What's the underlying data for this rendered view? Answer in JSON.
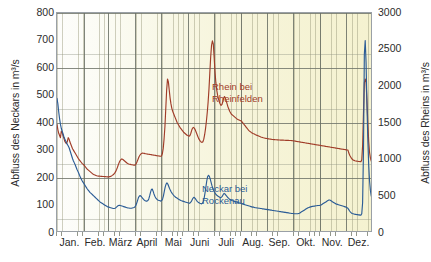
{
  "chart_data": {
    "type": "line",
    "title": "",
    "xlabel": "",
    "grid": true,
    "legend_position": "in-plot-annotations",
    "x_tick_labels": [
      "Jan.",
      "Feb.",
      "März",
      "April",
      "Mai",
      "Juni",
      "Juli",
      "Aug.",
      "Sep.",
      "Okt.",
      "Nov.",
      "Dez."
    ],
    "axes": {
      "left": {
        "label": "Abfluss des Neckars in m³/s",
        "ticks": [
          0,
          100,
          200,
          300,
          400,
          500,
          600,
          700,
          800
        ],
        "ylim": [
          0,
          800
        ],
        "color": "#2b5c96"
      },
      "right": {
        "label": "Abfluss des Rheins in m³/s",
        "ticks": [
          0,
          500,
          1000,
          1500,
          2000,
          2500,
          3000
        ],
        "ylim": [
          0,
          3000
        ],
        "color": "#a03c28"
      }
    },
    "annotations": [
      {
        "name": "rhein-label",
        "text_line1": "Rhein bei",
        "text_line2": "Rheinfelden",
        "color": "#a03c28"
      },
      {
        "name": "neckar-label",
        "text_line1": "Neckar bei",
        "text_line2": "Rockenau",
        "color": "#2b5c96"
      }
    ],
    "series": [
      {
        "name": "Rhein bei Rheinfelden",
        "axis": "right",
        "color": "#a03c28",
        "unit": "m³/s",
        "values": [
          1480,
          1410,
          1360,
          1330,
          1300,
          1390,
          1370,
          1330,
          1290,
          1250,
          1230,
          1220,
          1250,
          1300,
          1280,
          1240,
          1210,
          1180,
          1150,
          1130,
          1110,
          1090,
          1070,
          1050,
          1030,
          1010,
          995,
          980,
          965,
          950,
          940,
          930,
          915,
          900,
          885,
          870,
          860,
          850,
          840,
          830,
          820,
          810,
          800,
          795,
          790,
          785,
          780,
          778,
          776,
          775,
          774,
          773,
          772,
          771,
          770,
          769,
          768,
          767,
          766,
          765,
          765,
          768,
          772,
          778,
          786,
          795,
          805,
          820,
          840,
          865,
          895,
          930,
          960,
          985,
          1000,
          1010,
          1005,
          995,
          985,
          975,
          965,
          955,
          948,
          942,
          938,
          935,
          932,
          930,
          928,
          926,
          925,
          930,
          950,
          980,
          1010,
          1040,
          1060,
          1075,
          1085,
          1090,
          1088,
          1085,
          1082,
          1080,
          1078,
          1076,
          1074,
          1072,
          1070,
          1068,
          1066,
          1064,
          1062,
          1060,
          1058,
          1056,
          1054,
          1052,
          1050,
          1048,
          1046,
          1050,
          1080,
          1150,
          1280,
          1450,
          1700,
          1950,
          2100,
          2060,
          1950,
          1840,
          1760,
          1700,
          1660,
          1630,
          1600,
          1570,
          1540,
          1510,
          1490,
          1470,
          1450,
          1430,
          1415,
          1400,
          1385,
          1370,
          1360,
          1350,
          1340,
          1330,
          1325,
          1320,
          1330,
          1360,
          1400,
          1430,
          1440,
          1430,
          1410,
          1380,
          1350,
          1320,
          1290,
          1270,
          1250,
          1240,
          1235,
          1245,
          1280,
          1340,
          1420,
          1520,
          1640,
          1780,
          1960,
          2180,
          2400,
          2560,
          2620,
          2580,
          2400,
          2200,
          2050,
          1950,
          1880,
          1830,
          1790,
          1760,
          1740,
          1750,
          1790,
          1840,
          1860,
          1840,
          1800,
          1760,
          1720,
          1690,
          1660,
          1640,
          1620,
          1610,
          1600,
          1590,
          1580,
          1570,
          1560,
          1550,
          1545,
          1540,
          1535,
          1530,
          1520,
          1505,
          1490,
          1475,
          1460,
          1445,
          1430,
          1415,
          1400,
          1390,
          1380,
          1372,
          1365,
          1358,
          1352,
          1346,
          1340,
          1335,
          1330,
          1325,
          1320,
          1315,
          1310,
          1306,
          1302,
          1298,
          1295,
          1292,
          1290,
          1288,
          1286,
          1284,
          1282,
          1280,
          1278,
          1276,
          1275,
          1274,
          1273,
          1272,
          1271,
          1270,
          1269,
          1268,
          1268,
          1267,
          1267,
          1266,
          1266,
          1265,
          1265,
          1264,
          1264,
          1263,
          1263,
          1262,
          1262,
          1261,
          1260,
          1258,
          1256,
          1254,
          1252,
          1250,
          1248,
          1246,
          1244,
          1242,
          1240,
          1238,
          1236,
          1234,
          1232,
          1230,
          1228,
          1226,
          1224,
          1222,
          1220,
          1218,
          1216,
          1214,
          1212,
          1210,
          1208,
          1206,
          1204,
          1202,
          1200,
          1198,
          1196,
          1194,
          1192,
          1190,
          1188,
          1186,
          1184,
          1182,
          1180,
          1178,
          1176,
          1174,
          1172,
          1170,
          1168,
          1166,
          1164,
          1162,
          1160,
          1158,
          1156,
          1154,
          1152,
          1150,
          1148,
          1146,
          1144,
          1142,
          1140,
          1138,
          1136,
          1134,
          1132,
          1130,
          1090,
          1060,
          1040,
          1020,
          1005,
          995,
          990,
          985,
          982,
          980,
          978,
          976,
          975,
          974,
          973,
          1000,
          1200,
          1650,
          2050,
          2100,
          2050,
          1800,
          1500,
          1250,
          1100,
          1020,
          980,
          1050,
          1150
        ]
      },
      {
        "name": "Neckar bei Rockenau",
        "axis": "left",
        "color": "#2b5c96",
        "unit": "m³/s",
        "values": [
          490,
          470,
          440,
          415,
          395,
          380,
          370,
          360,
          350,
          342,
          335,
          328,
          322,
          316,
          310,
          300,
          290,
          280,
          270,
          262,
          255,
          248,
          240,
          232,
          225,
          218,
          210,
          203,
          196,
          190,
          185,
          180,
          175,
          170,
          165,
          160,
          156,
          152,
          148,
          145,
          142,
          139,
          136,
          133,
          130,
          127,
          124,
          121,
          118,
          115,
          112,
          110,
          108,
          106,
          104,
          102,
          100,
          98,
          96,
          95,
          94,
          93,
          92,
          91,
          90,
          89,
          89,
          90,
          92,
          95,
          98,
          100,
          101,
          100,
          99,
          98,
          97,
          96,
          95,
          94,
          93,
          92,
          91,
          91,
          90,
          90,
          90,
          91,
          92,
          93,
          95,
          100,
          108,
          118,
          128,
          134,
          136,
          134,
          130,
          126,
          122,
          119,
          117,
          116,
          116,
          118,
          124,
          135,
          148,
          158,
          160,
          152,
          142,
          134,
          128,
          124,
          121,
          119,
          118,
          117,
          116,
          118,
          124,
          136,
          152,
          168,
          178,
          182,
          178,
          170,
          162,
          155,
          149,
          144,
          140,
          136,
          133,
          130,
          128,
          126,
          124,
          122,
          120,
          118,
          117,
          116,
          115,
          114,
          113,
          112,
          111,
          110,
          109,
          108,
          110,
          114,
          120,
          126,
          130,
          128,
          124,
          119,
          115,
          112,
          110,
          108,
          107,
          106,
          108,
          115,
          128,
          146,
          168,
          190,
          205,
          210,
          206,
          196,
          184,
          172,
          162,
          154,
          148,
          143,
          139,
          136,
          134,
          132,
          130,
          129,
          130,
          134,
          140,
          144,
          142,
          138,
          134,
          130,
          127,
          124,
          122,
          120,
          118,
          117,
          116,
          115,
          114,
          113,
          112,
          111,
          110,
          109,
          108,
          107,
          106,
          105,
          104,
          103,
          102,
          101,
          100,
          99,
          98,
          97,
          96,
          95,
          94,
          94,
          93,
          92,
          92,
          91,
          91,
          90,
          90,
          89,
          89,
          88,
          88,
          87,
          87,
          86,
          86,
          85,
          85,
          84,
          84,
          83,
          83,
          82,
          82,
          81,
          81,
          80,
          80,
          79,
          79,
          78,
          78,
          77,
          77,
          76,
          76,
          75,
          75,
          74,
          74,
          73,
          73,
          72,
          72,
          71,
          71,
          71,
          70,
          70,
          70,
          70,
          70,
          71,
          72,
          74,
          76,
          78,
          80,
          82,
          84,
          86,
          88,
          90,
          92,
          93,
          94,
          95,
          96,
          97,
          97,
          98,
          98,
          99,
          99,
          100,
          100,
          100,
          101,
          102,
          104,
          106,
          108,
          110,
          112,
          114,
          116,
          118,
          120,
          120,
          118,
          116,
          114,
          112,
          110,
          108,
          106,
          105,
          104,
          103,
          102,
          101,
          100,
          99,
          98,
          97,
          96,
          95,
          94,
          92,
          90,
          85,
          80,
          76,
          73,
          71,
          70,
          69,
          68,
          68,
          67,
          67,
          66,
          66,
          65,
          65,
          70,
          110,
          300,
          650,
          700,
          620,
          470,
          340,
          250,
          190,
          155,
          135,
          125,
          120
        ]
      }
    ]
  }
}
